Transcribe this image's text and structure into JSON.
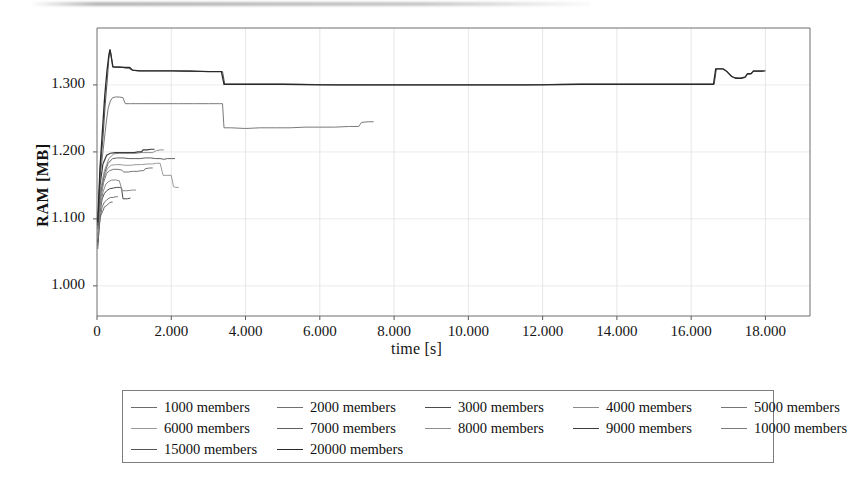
{
  "chart_data": {
    "type": "line",
    "title": "",
    "xlabel": "time [s]",
    "ylabel": "RAM [MB]",
    "xlim": [
      0,
      19.2
    ],
    "ylim": [
      0.955,
      1.385
    ],
    "xticks": [
      "0",
      "2.000",
      "4.000",
      "6.000",
      "8.000",
      "10.000",
      "12.000",
      "14.000",
      "16.000",
      "18.000"
    ],
    "xtick_values": [
      0,
      2,
      4,
      6,
      8,
      10,
      12,
      14,
      16,
      18
    ],
    "yticks": [
      "1.000",
      "1.100",
      "1.200",
      "1.300"
    ],
    "ytick_values": [
      1.0,
      1.1,
      1.2,
      1.3
    ],
    "grid": true,
    "legend_position": "below",
    "series": [
      {
        "name": "1000 members",
        "color": "#6b6b6b",
        "width": 1.0,
        "points": [
          [
            0.02,
            1.055
          ],
          [
            0.06,
            1.09
          ],
          [
            0.1,
            1.105
          ],
          [
            0.16,
            1.112
          ],
          [
            0.2,
            1.118
          ],
          [
            0.26,
            1.12
          ],
          [
            0.3,
            1.122
          ],
          [
            0.34,
            1.124
          ],
          [
            0.38,
            1.125
          ],
          [
            0.42,
            1.125
          ]
        ]
      },
      {
        "name": "2000 members",
        "color": "#707070",
        "width": 1.0,
        "points": [
          [
            0.02,
            1.06
          ],
          [
            0.08,
            1.1
          ],
          [
            0.14,
            1.118
          ],
          [
            0.2,
            1.125
          ],
          [
            0.26,
            1.128
          ],
          [
            0.3,
            1.13
          ],
          [
            0.36,
            1.132
          ],
          [
            0.44,
            1.132
          ],
          [
            0.5,
            1.133
          ],
          [
            0.56,
            1.133
          ]
        ]
      },
      {
        "name": "3000 members",
        "color": "#4a4a4a",
        "width": 1.0,
        "points": [
          [
            0.02,
            1.065
          ],
          [
            0.08,
            1.11
          ],
          [
            0.14,
            1.13
          ],
          [
            0.2,
            1.138
          ],
          [
            0.26,
            1.142
          ],
          [
            0.34,
            1.145
          ],
          [
            0.44,
            1.146
          ],
          [
            0.52,
            1.147
          ],
          [
            0.6,
            1.147
          ],
          [
            0.66,
            1.146
          ],
          [
            0.7,
            1.13
          ],
          [
            0.82,
            1.13
          ],
          [
            0.9,
            1.131
          ]
        ]
      },
      {
        "name": "4000 members",
        "color": "#8a8a8a",
        "width": 1.0,
        "points": [
          [
            0.02,
            1.07
          ],
          [
            0.08,
            1.115
          ],
          [
            0.16,
            1.14
          ],
          [
            0.24,
            1.152
          ],
          [
            0.32,
            1.156
          ],
          [
            0.4,
            1.158
          ],
          [
            0.5,
            1.158
          ],
          [
            0.6,
            1.157
          ],
          [
            0.68,
            1.142
          ],
          [
            0.8,
            1.142
          ],
          [
            0.95,
            1.143
          ],
          [
            1.05,
            1.143
          ]
        ]
      },
      {
        "name": "5000 members",
        "color": "#757575",
        "width": 1.0,
        "points": [
          [
            0.02,
            1.075
          ],
          [
            0.1,
            1.13
          ],
          [
            0.18,
            1.155
          ],
          [
            0.26,
            1.168
          ],
          [
            0.34,
            1.172
          ],
          [
            0.44,
            1.174
          ],
          [
            0.56,
            1.174
          ],
          [
            0.66,
            1.173
          ],
          [
            0.72,
            1.17
          ],
          [
            0.84,
            1.17
          ],
          [
            0.96,
            1.171
          ],
          [
            1.1,
            1.171
          ],
          [
            1.18,
            1.172
          ],
          [
            1.26,
            1.172
          ],
          [
            1.3,
            1.175
          ],
          [
            1.42,
            1.176
          ],
          [
            1.5,
            1.176
          ]
        ]
      },
      {
        "name": "6000 members",
        "color": "#9a9a9a",
        "width": 1.0,
        "points": [
          [
            0.02,
            1.08
          ],
          [
            0.1,
            1.135
          ],
          [
            0.18,
            1.16
          ],
          [
            0.28,
            1.175
          ],
          [
            0.38,
            1.18
          ],
          [
            0.5,
            1.181
          ],
          [
            0.62,
            1.181
          ],
          [
            0.76,
            1.18
          ],
          [
            0.9,
            1.18
          ],
          [
            1.05,
            1.181
          ],
          [
            1.2,
            1.181
          ],
          [
            1.35,
            1.182
          ],
          [
            1.5,
            1.182
          ],
          [
            1.6,
            1.183
          ],
          [
            1.7,
            1.183
          ],
          [
            1.78,
            1.165
          ],
          [
            1.88,
            1.165
          ],
          [
            2.0,
            1.165
          ],
          [
            2.06,
            1.148
          ],
          [
            2.12,
            1.147
          ],
          [
            2.2,
            1.147
          ]
        ]
      },
      {
        "name": "7000 members",
        "color": "#606060",
        "width": 1.0,
        "points": [
          [
            0.02,
            1.085
          ],
          [
            0.1,
            1.14
          ],
          [
            0.2,
            1.168
          ],
          [
            0.3,
            1.183
          ],
          [
            0.42,
            1.19
          ],
          [
            0.55,
            1.191
          ],
          [
            0.7,
            1.191
          ],
          [
            0.86,
            1.19
          ],
          [
            1.0,
            1.19
          ],
          [
            1.16,
            1.19
          ],
          [
            1.3,
            1.191
          ],
          [
            1.45,
            1.191
          ],
          [
            1.58,
            1.19
          ],
          [
            1.7,
            1.19
          ],
          [
            1.8,
            1.189
          ],
          [
            1.9,
            1.19
          ],
          [
            2.0,
            1.19
          ],
          [
            2.1,
            1.19
          ]
        ]
      },
      {
        "name": "8000 members",
        "color": "#8f8f8f",
        "width": 1.0,
        "points": [
          [
            0.02,
            1.088
          ],
          [
            0.1,
            1.145
          ],
          [
            0.2,
            1.172
          ],
          [
            0.32,
            1.19
          ],
          [
            0.45,
            1.197
          ],
          [
            0.6,
            1.198
          ],
          [
            0.75,
            1.198
          ],
          [
            0.9,
            1.198
          ],
          [
            1.05,
            1.198
          ],
          [
            1.2,
            1.199
          ],
          [
            1.35,
            1.199
          ],
          [
            1.5,
            1.199
          ],
          [
            1.6,
            1.202
          ],
          [
            1.72,
            1.203
          ],
          [
            1.8,
            1.203
          ]
        ]
      },
      {
        "name": "9000 members",
        "color": "#3d3d3d",
        "width": 1.2,
        "points": [
          [
            0.02,
            1.09
          ],
          [
            0.08,
            1.15
          ],
          [
            0.16,
            1.182
          ],
          [
            0.26,
            1.195
          ],
          [
            0.36,
            1.198
          ],
          [
            0.5,
            1.199
          ],
          [
            0.66,
            1.199
          ],
          [
            0.84,
            1.199
          ],
          [
            1.0,
            1.199
          ],
          [
            1.1,
            1.2
          ],
          [
            1.2,
            1.2
          ],
          [
            1.24,
            1.203
          ],
          [
            1.35,
            1.203
          ],
          [
            1.45,
            1.204
          ],
          [
            1.55,
            1.204
          ]
        ]
      },
      {
        "name": "10000 members",
        "color": "#7a7a7a",
        "width": 1.0,
        "points": [
          [
            0.02,
            1.09
          ],
          [
            0.08,
            1.16
          ],
          [
            0.16,
            1.2
          ],
          [
            0.24,
            1.24
          ],
          [
            0.3,
            1.265
          ],
          [
            0.36,
            1.276
          ],
          [
            0.42,
            1.281
          ],
          [
            0.5,
            1.282
          ],
          [
            0.6,
            1.282
          ],
          [
            0.7,
            1.281
          ],
          [
            0.76,
            1.272
          ],
          [
            0.9,
            1.272
          ],
          [
            1.1,
            1.272
          ],
          [
            1.4,
            1.272
          ],
          [
            1.8,
            1.272
          ],
          [
            2.2,
            1.272
          ],
          [
            2.6,
            1.272
          ],
          [
            3.0,
            1.272
          ],
          [
            3.3,
            1.272
          ],
          [
            3.38,
            1.272
          ],
          [
            3.42,
            1.236
          ],
          [
            3.6,
            1.236
          ],
          [
            4.0,
            1.235
          ],
          [
            4.4,
            1.236
          ],
          [
            4.8,
            1.236
          ],
          [
            5.2,
            1.236
          ],
          [
            5.6,
            1.237
          ],
          [
            6.0,
            1.237
          ],
          [
            6.4,
            1.237
          ],
          [
            6.8,
            1.238
          ],
          [
            7.05,
            1.238
          ],
          [
            7.12,
            1.244
          ],
          [
            7.3,
            1.245
          ],
          [
            7.45,
            1.245
          ]
        ]
      },
      {
        "name": "15000 members",
        "color": "#555555",
        "width": 1.0,
        "points": [
          [
            0.02,
            1.09
          ],
          [
            0.08,
            1.17
          ],
          [
            0.16,
            1.22
          ],
          [
            0.22,
            1.27
          ],
          [
            0.28,
            1.31
          ],
          [
            0.32,
            1.34
          ],
          [
            0.35,
            1.352
          ],
          [
            0.38,
            1.345
          ],
          [
            0.42,
            1.327
          ],
          [
            0.48,
            1.326
          ],
          [
            0.56,
            1.326
          ],
          [
            0.7,
            1.326
          ],
          [
            0.85,
            1.325
          ],
          [
            0.95,
            1.322
          ],
          [
            1.1,
            1.321
          ],
          [
            1.3,
            1.321
          ],
          [
            1.6,
            1.321
          ],
          [
            2.0,
            1.321
          ],
          [
            2.4,
            1.32
          ],
          [
            2.8,
            1.32
          ],
          [
            3.2,
            1.32
          ],
          [
            3.38,
            1.32
          ],
          [
            3.44,
            1.301
          ],
          [
            3.8,
            1.301
          ],
          [
            4.5,
            1.301
          ],
          [
            5.5,
            1.301
          ],
          [
            6.5,
            1.3
          ],
          [
            7.5,
            1.3
          ],
          [
            8.5,
            1.3
          ],
          [
            9.5,
            1.3
          ],
          [
            10.5,
            1.3
          ],
          [
            11.5,
            1.3
          ],
          [
            12.5,
            1.301
          ],
          [
            13.5,
            1.301
          ],
          [
            14.5,
            1.301
          ],
          [
            15.5,
            1.301
          ],
          [
            16.3,
            1.301
          ],
          [
            16.62,
            1.301
          ],
          [
            16.68,
            1.324
          ],
          [
            16.85,
            1.324
          ],
          [
            16.95,
            1.321
          ],
          [
            17.05,
            1.315
          ],
          [
            17.15,
            1.311
          ],
          [
            17.3,
            1.31
          ],
          [
            17.45,
            1.311
          ],
          [
            17.5,
            1.316
          ],
          [
            17.6,
            1.316
          ],
          [
            17.66,
            1.32
          ],
          [
            17.8,
            1.32
          ],
          [
            17.95,
            1.32
          ]
        ]
      },
      {
        "name": "20000 members",
        "color": "#2a2a2a",
        "width": 1.3,
        "points": [
          [
            0.02,
            1.095
          ],
          [
            0.08,
            1.175
          ],
          [
            0.15,
            1.235
          ],
          [
            0.21,
            1.285
          ],
          [
            0.27,
            1.322
          ],
          [
            0.32,
            1.345
          ],
          [
            0.35,
            1.353
          ],
          [
            0.39,
            1.34
          ],
          [
            0.43,
            1.327
          ],
          [
            0.5,
            1.327
          ],
          [
            0.6,
            1.327
          ],
          [
            0.75,
            1.326
          ],
          [
            0.88,
            1.326
          ],
          [
            0.96,
            1.322
          ],
          [
            1.15,
            1.321
          ],
          [
            1.5,
            1.321
          ],
          [
            2.0,
            1.321
          ],
          [
            2.5,
            1.321
          ],
          [
            3.0,
            1.32
          ],
          [
            3.35,
            1.32
          ],
          [
            3.42,
            1.301
          ],
          [
            4.0,
            1.301
          ],
          [
            5.0,
            1.301
          ],
          [
            6.0,
            1.3
          ],
          [
            7.0,
            1.3
          ],
          [
            8.0,
            1.3
          ],
          [
            9.0,
            1.3
          ],
          [
            10.0,
            1.3
          ],
          [
            11.0,
            1.3
          ],
          [
            12.0,
            1.3
          ],
          [
            13.0,
            1.301
          ],
          [
            14.0,
            1.301
          ],
          [
            15.0,
            1.301
          ],
          [
            16.0,
            1.301
          ],
          [
            16.6,
            1.301
          ],
          [
            16.66,
            1.324
          ],
          [
            16.86,
            1.324
          ],
          [
            16.96,
            1.32
          ],
          [
            17.08,
            1.313
          ],
          [
            17.2,
            1.31
          ],
          [
            17.35,
            1.31
          ],
          [
            17.46,
            1.312
          ],
          [
            17.52,
            1.317
          ],
          [
            17.62,
            1.317
          ],
          [
            17.68,
            1.321
          ],
          [
            17.85,
            1.321
          ],
          [
            18.0,
            1.321
          ]
        ]
      }
    ]
  },
  "legend": {
    "rows": [
      [
        "1000 members",
        "2000 members",
        "3000 members",
        "4000 members",
        "5000 members"
      ],
      [
        "6000 members",
        "7000 members",
        "8000 members",
        "9000 members",
        "10000 members"
      ],
      [
        "15000 members",
        "20000 members"
      ]
    ]
  }
}
